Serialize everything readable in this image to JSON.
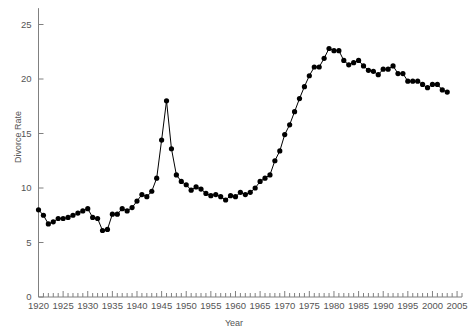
{
  "chart_data": {
    "type": "line",
    "title": "",
    "xlabel": "Year",
    "ylabel": "Divorce Rate",
    "xlim": [
      1920,
      2006
    ],
    "ylim": [
      0,
      26.5
    ],
    "grid": false,
    "legend": "none",
    "marker": "filled-circle",
    "line_color": "#000000",
    "marker_color": "#000000",
    "axis_color": "#808080",
    "tick_label_color": "#555555",
    "y_ticks": [
      0,
      5,
      10,
      15,
      20,
      25
    ],
    "y_tick_labels": [
      "0",
      "5",
      "10",
      "15",
      "20",
      "25"
    ],
    "x_ticks": [
      1920,
      1925,
      1930,
      1935,
      1940,
      1945,
      1950,
      1955,
      1960,
      1965,
      1970,
      1975,
      1980,
      1985,
      1990,
      1995,
      2000,
      2005
    ],
    "x_tick_labels": [
      "1920",
      "1925",
      "1930",
      "1935",
      "1940",
      "1945",
      "1950",
      "1955",
      "1960",
      "1965",
      "1970",
      "1975",
      "1980",
      "1985",
      "1990",
      "1995",
      "2000",
      "2005"
    ],
    "x_minor_tick_step": 1,
    "x": [
      1920,
      1921,
      1922,
      1923,
      1924,
      1925,
      1926,
      1927,
      1928,
      1929,
      1930,
      1931,
      1932,
      1933,
      1934,
      1935,
      1936,
      1937,
      1938,
      1939,
      1940,
      1941,
      1942,
      1943,
      1944,
      1945,
      1946,
      1947,
      1948,
      1949,
      1950,
      1951,
      1952,
      1953,
      1954,
      1955,
      1956,
      1957,
      1958,
      1959,
      1960,
      1961,
      1962,
      1963,
      1964,
      1965,
      1966,
      1967,
      1968,
      1969,
      1970,
      1971,
      1972,
      1973,
      1974,
      1975,
      1976,
      1977,
      1978,
      1979,
      1980,
      1981,
      1982,
      1983,
      1984,
      1985,
      1986,
      1987,
      1988,
      1989,
      1990,
      1991,
      1992,
      1993,
      1994,
      1995,
      1996,
      1997,
      1998,
      1999,
      2000,
      2001,
      2002,
      2003
    ],
    "y": [
      8.0,
      7.5,
      6.7,
      6.9,
      7.2,
      7.2,
      7.3,
      7.5,
      7.7,
      7.9,
      8.1,
      7.3,
      7.2,
      6.1,
      6.2,
      7.6,
      7.6,
      8.1,
      7.9,
      8.2,
      8.8,
      9.4,
      9.2,
      9.7,
      10.9,
      14.4,
      18.0,
      13.6,
      11.2,
      10.6,
      10.3,
      9.8,
      10.1,
      9.9,
      9.5,
      9.3,
      9.4,
      9.2,
      8.9,
      9.3,
      9.2,
      9.6,
      9.4,
      9.6,
      10.0,
      10.6,
      10.9,
      11.2,
      12.5,
      13.4,
      14.9,
      15.8,
      17.0,
      18.2,
      19.3,
      20.3,
      21.1,
      21.1,
      21.9,
      22.8,
      22.6,
      22.6,
      21.7,
      21.3,
      21.5,
      21.7,
      21.2,
      20.8,
      20.7,
      20.4,
      20.9,
      20.9,
      21.2,
      20.5,
      20.5,
      19.8,
      19.8,
      19.8,
      19.5,
      19.2,
      19.5,
      19.5,
      19.0,
      18.8
    ],
    "series_name": "Divorce Rate"
  },
  "axis_titles": {
    "x": "Year",
    "y": "Divorce Rate"
  }
}
